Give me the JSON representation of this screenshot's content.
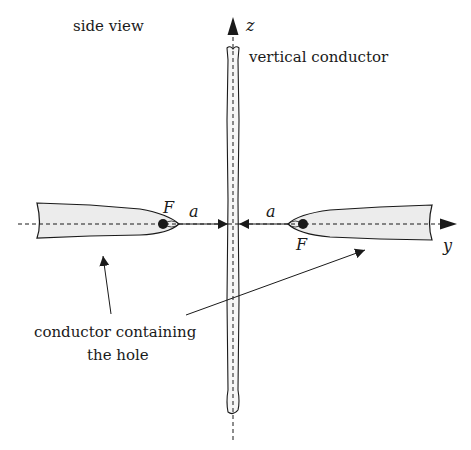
{
  "labels": {
    "view_title": "side view",
    "z_axis": "z",
    "y_axis": "y",
    "vertical_conductor": "vertical conductor",
    "focus_left": "F",
    "focus_right": "F",
    "distance_left": "a",
    "distance_right": "a",
    "callout_line1": "conductor containing",
    "callout_line2": "the hole"
  },
  "colors": {
    "stroke": "#1a1a1a",
    "conductor_fill": "#eeeeee",
    "background": "#ffffff"
  }
}
